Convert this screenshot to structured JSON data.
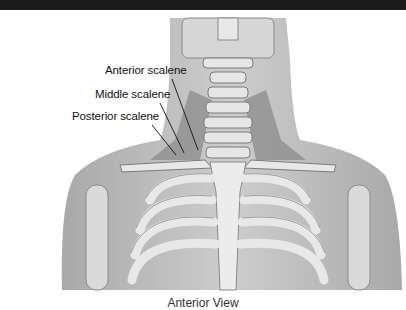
{
  "figure": {
    "labels": [
      {
        "text": "Anterior scalene"
      },
      {
        "text": "Middle scalene"
      },
      {
        "text": "Posterior scalene"
      }
    ],
    "caption": "Anterior View"
  },
  "colors": {
    "topbar": "#1c1c1c",
    "skin": "#b9b9b9",
    "bone": "#e4e4e4",
    "muscle": "#8a8a8a",
    "background": "#ffffff"
  }
}
